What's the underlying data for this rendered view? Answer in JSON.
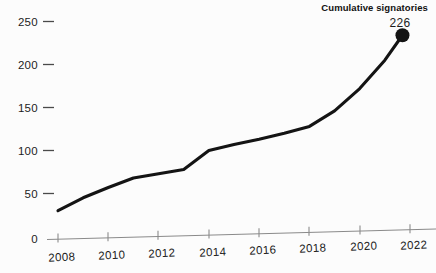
{
  "chart_data": {
    "type": "line",
    "title": "",
    "xlabel": "",
    "ylabel": "",
    "xlim": [
      2008,
      2022.8
    ],
    "ylim": [
      0,
      262
    ],
    "grid": false,
    "legend_position": "none",
    "x_ticks": [
      "2008",
      "2010",
      "2012",
      "2014",
      "2016",
      "2018",
      "2020",
      "2022"
    ],
    "x_tick_values": [
      2008,
      2010,
      2012,
      2014,
      2016,
      2018,
      2020,
      2022
    ],
    "y_ticks": [
      "0",
      "50",
      "100",
      "150",
      "200",
      "250"
    ],
    "y_tick_values": [
      0,
      50,
      100,
      150,
      200,
      250
    ],
    "series": [
      {
        "name": "Cumulative signatories",
        "color": "#141414",
        "x": [
          2008,
          2009,
          2010,
          2011,
          2012,
          2013,
          2014,
          2015,
          2016,
          2017,
          2018,
          2019,
          2020,
          2021,
          2021.7
        ],
        "values": [
          30,
          45,
          57,
          68,
          73,
          78,
          100,
          107,
          113,
          120,
          128,
          146,
          172,
          205,
          234
        ]
      }
    ],
    "annotations": [
      {
        "name": "series-label",
        "text": "Cumulative signatories",
        "x": 2021.7,
        "y": 234
      },
      {
        "name": "end-value-label",
        "text": "226",
        "x": 2021.7,
        "y": 234
      }
    ],
    "end_point": {
      "x": 2021.7,
      "y": 234,
      "label": "226"
    }
  },
  "colors": {
    "background": "#fcfcfc",
    "line": "#141414",
    "axis": "#8a8a8a",
    "text": "#1c1c1c"
  }
}
